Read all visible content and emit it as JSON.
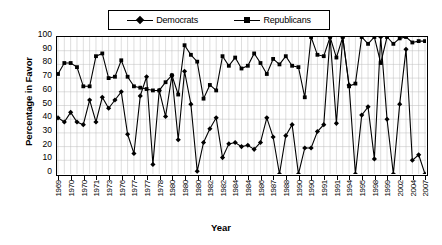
{
  "chart_data": {
    "type": "line",
    "title": "",
    "xlabel": "Year",
    "ylabel": "Percentage in Favor",
    "ylim": [
      0,
      100
    ],
    "yticks": [
      0,
      10,
      20,
      30,
      40,
      50,
      60,
      70,
      80,
      90,
      100
    ],
    "grid": true,
    "legend_position": "top",
    "x_tick_labels": [
      "1969",
      "1970",
      "1970",
      "1971",
      "1973",
      "1976",
      "1977",
      "1977",
      "1978",
      "1980",
      "1980",
      "1980",
      "1982",
      "1982",
      "1984",
      "1984",
      "1986",
      "1987",
      "1988",
      "1990",
      "1990",
      "1991",
      "1991",
      "1994",
      "1995",
      "1998",
      "1999",
      "2002",
      "2004",
      "2007"
    ],
    "x_tick_indices": [
      0,
      2,
      4,
      6,
      8,
      10,
      12,
      14,
      16,
      18,
      20,
      22,
      24,
      26,
      28,
      30,
      32,
      34,
      36,
      38,
      40,
      42,
      44,
      46,
      48,
      50,
      52,
      54,
      56,
      58
    ],
    "series": [
      {
        "name": "Democrats",
        "marker": "diamond",
        "values": [
          41,
          38,
          45,
          38,
          36,
          54,
          38,
          56,
          48,
          54,
          60,
          29,
          15,
          57,
          71,
          7,
          61,
          42,
          72,
          25,
          75,
          51,
          2,
          23,
          33,
          41,
          12,
          22,
          23,
          20,
          21,
          18,
          23,
          41,
          27,
          0,
          28,
          36,
          0,
          19,
          19,
          31,
          36,
          100,
          37,
          100,
          65,
          0,
          43,
          49,
          11,
          100,
          40,
          0,
          51,
          91,
          10,
          14,
          0
        ]
      },
      {
        "name": "Republicans",
        "marker": "square",
        "values": [
          73,
          81,
          81,
          78,
          64,
          64,
          86,
          88,
          70,
          71,
          83,
          71,
          64,
          63,
          62,
          61,
          61,
          67,
          72,
          58,
          94,
          87,
          82,
          55,
          65,
          61,
          86,
          79,
          85,
          77,
          79,
          88,
          81,
          73,
          84,
          80,
          86,
          79,
          78,
          56,
          100,
          87,
          86,
          100,
          85,
          100,
          64,
          66,
          100,
          95,
          100,
          81,
          100,
          95,
          99,
          100,
          96,
          97,
          97
        ]
      }
    ]
  },
  "legend": {
    "entries": [
      {
        "label": "Democrats",
        "marker": "diamond"
      },
      {
        "label": "Republicans",
        "marker": "square"
      }
    ]
  },
  "axes": {
    "y_title": "Percentage in Favor",
    "x_title": "Year"
  }
}
